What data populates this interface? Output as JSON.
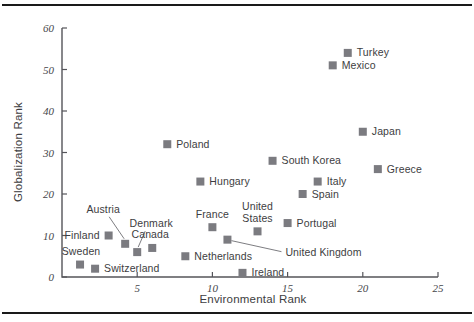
{
  "figure": {
    "background_color": "#ffffff",
    "rule_color": "#1a1a1a",
    "marker_color": "#7b7b80",
    "axis_color": "#55555a",
    "text_color": "#3d3d41"
  },
  "chart_data": {
    "type": "scatter",
    "title": "",
    "xlabel": "Environmental Rank",
    "ylabel": "Globalization Rank",
    "xlim": [
      0,
      25
    ],
    "ylim": [
      0,
      60
    ],
    "xticks": [
      5,
      10,
      15,
      20,
      25
    ],
    "yticks": [
      0,
      10,
      20,
      30,
      40,
      50,
      60
    ],
    "grid": false,
    "legend": "none",
    "marker_shape": "square",
    "points": [
      {
        "label": "Sweden",
        "x": 1.2,
        "y": 3,
        "label_pos": "above-left"
      },
      {
        "label": "Switzerland",
        "x": 2.2,
        "y": 2,
        "label_pos": "right"
      },
      {
        "label": "Finland",
        "x": 3.1,
        "y": 10,
        "label_pos": "left"
      },
      {
        "label": "Austria",
        "x": 4.2,
        "y": 8,
        "label_pos": "leader-up-left"
      },
      {
        "label": "Denmark",
        "x": 5.0,
        "y": 6,
        "label_pos": "leader-up-right"
      },
      {
        "label": "Canada",
        "x": 6.0,
        "y": 7,
        "label_pos": "above-right"
      },
      {
        "label": "Poland",
        "x": 7.0,
        "y": 32,
        "label_pos": "right"
      },
      {
        "label": "Netherlands",
        "x": 8.2,
        "y": 5,
        "label_pos": "right"
      },
      {
        "label": "Hungary",
        "x": 9.2,
        "y": 23,
        "label_pos": "right"
      },
      {
        "label": "France",
        "x": 10.0,
        "y": 12,
        "label_pos": "above"
      },
      {
        "label": "United Kingdom",
        "x": 11.0,
        "y": 9,
        "label_pos": "leader-right"
      },
      {
        "label": "Ireland",
        "x": 12.0,
        "y": 1,
        "label_pos": "right"
      },
      {
        "label": "United States",
        "x": 13.0,
        "y": 11,
        "label_pos": "above"
      },
      {
        "label": "South Korea",
        "x": 14.0,
        "y": 28,
        "label_pos": "right"
      },
      {
        "label": "Portugal",
        "x": 15.0,
        "y": 13,
        "label_pos": "right"
      },
      {
        "label": "Spain",
        "x": 16.0,
        "y": 20,
        "label_pos": "right"
      },
      {
        "label": "Italy",
        "x": 17.0,
        "y": 23,
        "label_pos": "right"
      },
      {
        "label": "Mexico",
        "x": 18.0,
        "y": 51,
        "label_pos": "right"
      },
      {
        "label": "Turkey",
        "x": 19.0,
        "y": 54,
        "label_pos": "right"
      },
      {
        "label": "Japan",
        "x": 20.0,
        "y": 35,
        "label_pos": "right"
      },
      {
        "label": "Greece",
        "x": 21.0,
        "y": 26,
        "label_pos": "right"
      }
    ]
  }
}
